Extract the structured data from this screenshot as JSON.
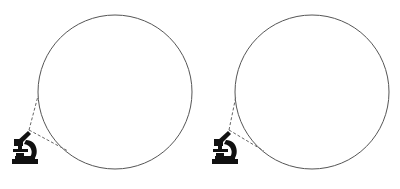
{
  "diagram": {
    "description": "Two identical magnified-view diagrams: a microscope with dashed view lines leading to a large empty circle (field of view)",
    "panels": [
      {
        "id": "left",
        "circle": {
          "cx": 115,
          "cy": 92,
          "r": 77,
          "stroke": "#555555"
        },
        "microscope": {
          "x": 10,
          "y": 128,
          "color": "#111111"
        },
        "eyepiece": {
          "x": 29,
          "y": 130
        },
        "view_lines": [
          {
            "x1": 29,
            "y1": 130,
            "x2": 38,
            "y2": 96
          },
          {
            "x1": 29,
            "y1": 130,
            "x2": 68,
            "y2": 151
          }
        ]
      },
      {
        "id": "right",
        "circle": {
          "cx": 112,
          "cy": 92,
          "r": 77,
          "stroke": "#555555"
        },
        "microscope": {
          "x": 10,
          "y": 128,
          "color": "#111111"
        },
        "eyepiece": {
          "x": 29,
          "y": 130
        },
        "view_lines": [
          {
            "x1": 29,
            "y1": 130,
            "x2": 36,
            "y2": 96
          },
          {
            "x1": 29,
            "y1": 130,
            "x2": 64,
            "y2": 151
          }
        ]
      }
    ],
    "line_style": {
      "dash": "3,2",
      "color": "#666666"
    }
  }
}
